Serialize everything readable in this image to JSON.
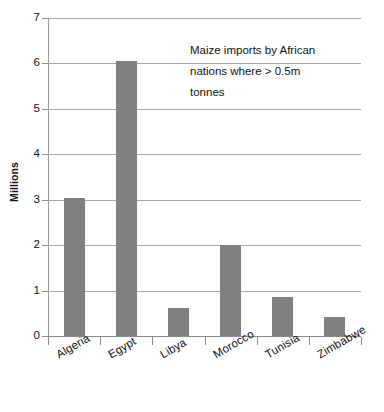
{
  "chart_data": {
    "type": "bar",
    "title": "Maize imports by African nations where > 0.5m tonnes",
    "title_lines": [
      "Maize imports by African",
      "nations where > 0.5m",
      "tonnes"
    ],
    "xlabel": "",
    "ylabel": "Millions",
    "categories": [
      "Algeria",
      "Egypt",
      "Libya",
      "Morocco",
      "Tunisia",
      "Zimbabwe"
    ],
    "values": [
      3.04,
      6.05,
      0.62,
      2.0,
      0.85,
      0.42
    ],
    "ylim": [
      0,
      7
    ],
    "ytick_labels": [
      "0",
      "1",
      "2",
      "3",
      "4",
      "5",
      "6",
      "7"
    ],
    "ytick_values": [
      0,
      1,
      2,
      3,
      4,
      5,
      6,
      7
    ],
    "grid": true,
    "legend": false,
    "bar_color": "#808080",
    "gridline_color": "#a6a6a6",
    "axis_color": "#8a8a8a",
    "background_color": "#ffffff",
    "text_color": "#111111"
  }
}
